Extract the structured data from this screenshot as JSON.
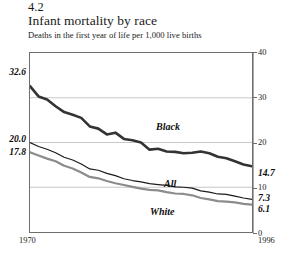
{
  "figure": {
    "number": "4.2",
    "title": "Infant mortality by race",
    "subtitle": "Deaths in the first year of life per 1,000 live births"
  },
  "axes": {
    "x_start_label": "1970",
    "x_end_label": "1996",
    "y_ticks": [
      "40",
      "30",
      "20",
      "10",
      "0"
    ]
  },
  "callouts": {
    "black_start": "32.6",
    "all_start": "20.0",
    "white_start": "17.8",
    "black_end": "14.7",
    "all_end": "7.3",
    "white_end": "6.1"
  },
  "series_labels": {
    "black": "Black",
    "all": "All",
    "white": "White"
  },
  "colors": {
    "black_line": "#333333",
    "all_line": "#1a1a1a",
    "white_line": "#8c8c8c",
    "grid": "#c8c8c8",
    "frame": "#6e6e6e",
    "text": "#1a1a1a"
  },
  "chart_data": {
    "type": "line",
    "title": "Infant mortality by race",
    "subtitle": "Deaths in the first year of life per 1,000 live births",
    "xlabel": "",
    "ylabel": "Deaths per 1,000 live births",
    "xlim": [
      1970,
      1996
    ],
    "ylim": [
      0,
      40
    ],
    "yticks": [
      0,
      10,
      20,
      30,
      40
    ],
    "grid": "horizontal",
    "y_axis_position": "right",
    "legend": "inline-labels",
    "x": [
      1970,
      1971,
      1972,
      1973,
      1974,
      1975,
      1976,
      1977,
      1978,
      1979,
      1980,
      1981,
      1982,
      1983,
      1984,
      1985,
      1986,
      1987,
      1988,
      1989,
      1990,
      1991,
      1992,
      1993,
      1994,
      1995,
      1996
    ],
    "series": [
      {
        "name": "Black",
        "color": "#333333",
        "start_value": 32.6,
        "end_value": 14.7,
        "values": [
          32.6,
          30.3,
          29.6,
          28.1,
          26.8,
          26.2,
          25.5,
          23.6,
          23.1,
          21.8,
          22.2,
          20.8,
          20.5,
          20.0,
          18.4,
          18.6,
          18.0,
          17.9,
          17.6,
          17.7,
          18.0,
          17.6,
          16.8,
          16.5,
          15.8,
          15.1,
          14.7
        ]
      },
      {
        "name": "All",
        "color": "#1a1a1a",
        "start_value": 20.0,
        "end_value": 7.3,
        "values": [
          20.0,
          19.1,
          18.5,
          17.7,
          16.7,
          16.1,
          15.2,
          14.1,
          13.8,
          13.1,
          12.6,
          11.9,
          11.5,
          11.2,
          10.8,
          10.6,
          10.4,
          10.1,
          10.0,
          9.8,
          9.2,
          8.9,
          8.5,
          8.4,
          8.0,
          7.6,
          7.3
        ]
      },
      {
        "name": "White",
        "color": "#8c8c8c",
        "start_value": 17.8,
        "end_value": 6.1,
        "values": [
          17.8,
          17.1,
          16.4,
          15.8,
          14.8,
          14.2,
          13.3,
          12.3,
          12.0,
          11.4,
          10.9,
          10.5,
          10.1,
          9.7,
          9.4,
          9.3,
          8.9,
          8.6,
          8.5,
          8.2,
          7.6,
          7.3,
          6.9,
          6.8,
          6.6,
          6.3,
          6.1
        ]
      }
    ]
  }
}
